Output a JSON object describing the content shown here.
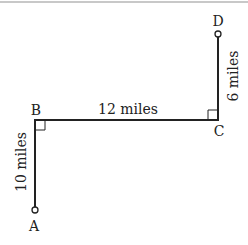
{
  "diagram": {
    "title": "",
    "points": [
      {
        "label": "A",
        "x": 35,
        "y": 210
      },
      {
        "label": "B",
        "x": 35,
        "y": 120
      },
      {
        "label": "C",
        "x": 218,
        "y": 120
      },
      {
        "label": "D",
        "x": 218,
        "y": 34
      }
    ],
    "segments": [
      {
        "from": "A",
        "to": "B",
        "label": "10 miles"
      },
      {
        "from": "B",
        "to": "C",
        "label": "12 miles"
      },
      {
        "from": "C",
        "to": "D",
        "label": "6 miles"
      }
    ],
    "right_angles": [
      "B",
      "C"
    ],
    "colors": {
      "line": "#222222",
      "border": "#c8c8c8"
    }
  }
}
